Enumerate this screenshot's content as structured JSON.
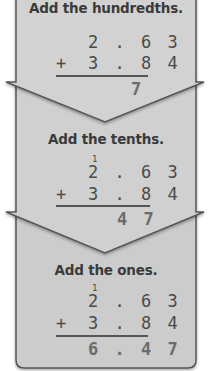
{
  "colors": {
    "panel": "#cfcfcf",
    "border": "#5a5a5a",
    "text": "#3a3a3a",
    "result": "#6b6b6b"
  },
  "steps": [
    {
      "title": "Add the hundredths.",
      "carry": "",
      "addend1": "2.63",
      "operator": "+",
      "addend2": "3.84",
      "result": "7"
    },
    {
      "title": "Add the tenths.",
      "carry": "1",
      "addend1": "2.63",
      "operator": "+",
      "addend2": "3.84",
      "result": "47"
    },
    {
      "title": "Add the ones.",
      "carry": "1",
      "addend1": "2.63",
      "operator": "+",
      "addend2": "3.84",
      "result": "6.47"
    }
  ],
  "display": {
    "s0_a1": "2 . 6 3",
    "s0_op": "+",
    "s0_a2": "3 . 8 4",
    "s0_res": "7",
    "s1_carry": "1",
    "s1_a1": "2 . 6 3",
    "s1_op": "+",
    "s1_a2": "3 . 8 4",
    "s1_res": "4 7",
    "s2_carry": "1",
    "s2_a1": "2 . 6 3",
    "s2_op": "+",
    "s2_a2": "3 . 8 4",
    "s2_res": "6 . 4 7"
  }
}
